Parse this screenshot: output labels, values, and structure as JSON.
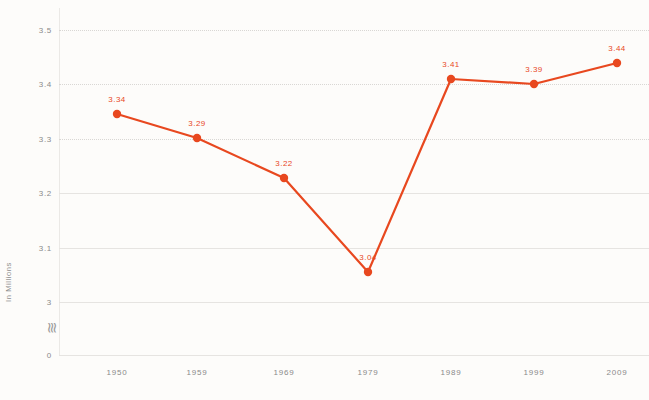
{
  "chart_data": {
    "type": "line",
    "title": "",
    "xlabel": "",
    "ylabel": "In Millions",
    "categories": [
      "1950",
      "1959",
      "1969",
      "1979",
      "1989",
      "1999",
      "2009"
    ],
    "values": [
      3.34,
      3.29,
      3.22,
      3.04,
      3.41,
      3.39,
      3.44
    ],
    "point_labels": [
      "3.34",
      "3.29",
      "3.22",
      "3.04",
      "3.41",
      "3.39",
      "3.44"
    ],
    "y_ticks": [
      "0",
      "3",
      "3.1",
      "3.2",
      "3.3",
      "3.4",
      "3.5"
    ],
    "ylim": [
      3.0,
      3.5
    ],
    "y_axis_broken": true,
    "axis_break_symbol": "≋",
    "grid": true,
    "legend": "none",
    "series_color": "#e8481f",
    "grid_color": "#d9d7d4",
    "background_color": "#fdfcfa",
    "tick_label_color": "#8a8a8a"
  },
  "axis": {
    "y_title": "In Millions"
  },
  "y_ticks": [
    {
      "label": "3.5",
      "y": 30
    },
    {
      "label": "3.4",
      "y": 84
    },
    {
      "label": "3.3",
      "y": 139
    },
    {
      "label": "3.2",
      "y": 193
    },
    {
      "label": "3.1",
      "y": 248
    },
    {
      "label": "3",
      "y": 302
    },
    {
      "label": "0",
      "y": 355
    }
  ],
  "x_ticks": [
    {
      "label": "1950",
      "x": 117
    },
    {
      "label": "1959",
      "x": 197
    },
    {
      "label": "1969",
      "x": 284
    },
    {
      "label": "1969b",
      "x": 0
    }
  ],
  "points": [
    {
      "label": "3.34",
      "x": 117,
      "y": 114
    },
    {
      "label": "3.29",
      "x": 197,
      "y": 138
    },
    {
      "label": "3.22",
      "x": 284,
      "y": 178
    },
    {
      "label": "3.04",
      "x": 368,
      "y": 272
    },
    {
      "label": "3.41",
      "x": 451,
      "y": 79
    },
    {
      "label": "3.39",
      "x": 534,
      "y": 84
    },
    {
      "label": "3.44",
      "x": 617,
      "y": 63
    }
  ]
}
